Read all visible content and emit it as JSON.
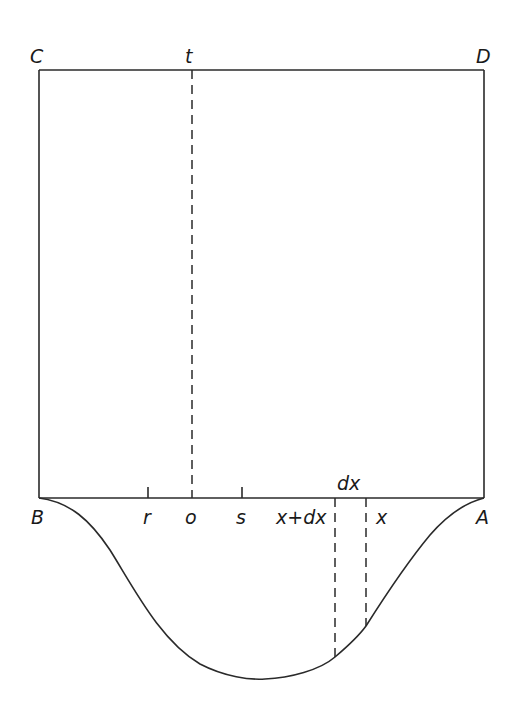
{
  "diagram": {
    "type": "geometric-figure",
    "labels": {
      "C": "C",
      "D": "D",
      "t": "t",
      "B": "B",
      "A": "A",
      "r": "r",
      "o": "o",
      "s": "s",
      "x_plus_dx": "x+dx",
      "x": "x",
      "dx": "dx"
    },
    "colors": {
      "line": "#2a2a2a",
      "text": "#1a1a1a",
      "background": "#ffffff"
    }
  }
}
